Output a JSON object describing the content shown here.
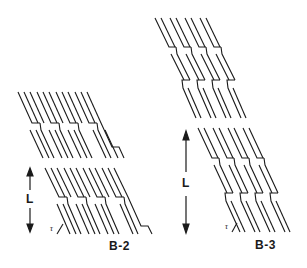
{
  "figure": {
    "panels": [
      {
        "id": "B-2",
        "label": "B-2",
        "dimension_label": "L",
        "angle_label": "τ",
        "blocks": 2,
        "strips_per_block": 12,
        "steps_per_block": 1
      },
      {
        "id": "B-3",
        "label": "B-3",
        "dimension_label": "L",
        "angle_label": "τ",
        "blocks": 2,
        "strips_per_block": 8,
        "steps_per_block": 2
      }
    ],
    "colors": {
      "line": "#1a1a1a",
      "background": "#ffffff"
    }
  }
}
